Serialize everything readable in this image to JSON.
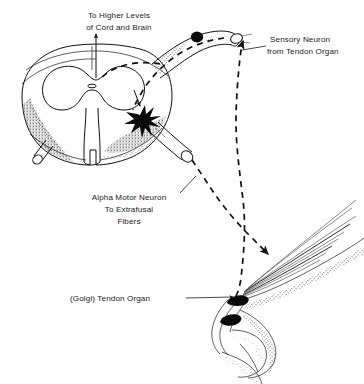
{
  "figure": {
    "background_color": "#ffffff",
    "ink_color": "#111111",
    "width": 364,
    "height": 384
  },
  "labels": {
    "ascending_tract": {
      "line1": "To Higher Levels",
      "line2": "of Cord and Brain"
    },
    "sensory_neuron": {
      "line1": "Sensory Neuron",
      "line2": "from Tendon Organ"
    },
    "alpha_motor_neuron": {
      "line1": "Alpha Motor Neuron",
      "line2": "To Extrafusal",
      "line3": "Fibers"
    },
    "tendon_organ": {
      "line1": "(Golgi) Tendon Organ"
    }
  },
  "structures": {
    "spinal_cord": "spinal-cord-cross-section",
    "gray_matter": "butterfly-gray-matter",
    "central_canal": "central-canal",
    "dorsal_root_ganglion": "dorsal-root-ganglion",
    "ganglion_cell_body": "sensory-cell-body",
    "ventral_root": "ventral-root",
    "interneuron_synapse": "inhibitory-interneuron-starburst",
    "muscle": "skeletal-muscle-extrafusal-fibers",
    "tendon": "tendon",
    "golgi_organ": "golgi-tendon-organ",
    "bone": "bone"
  },
  "pathways": {
    "sensory_afferent": "dashed-line-from-tendon-organ-to-dorsal-root",
    "motor_efferent": "dashed-line-from-ventral-root-to-muscle",
    "ascending": "solid-arrow-upward"
  }
}
